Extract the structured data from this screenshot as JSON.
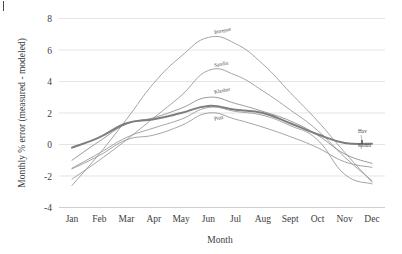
{
  "chart_data": {
    "type": "line",
    "title": "",
    "xlabel": "Month",
    "ylabel": "Monthly % error (measured - modeled)",
    "categories": [
      "Jan",
      "Feb",
      "Mar",
      "Apr",
      "May",
      "Jun",
      "Jul",
      "Aug",
      "Sept",
      "Oct",
      "Nov",
      "Dec"
    ],
    "ylim": [
      -4,
      8
    ],
    "yticks": [
      8,
      6,
      4,
      2,
      0,
      -2,
      -4
    ],
    "ytick_labels": [
      "8",
      "6",
      "4",
      "2",
      "0",
      "-2",
      "-4"
    ],
    "grid": true,
    "legend": "inline-series-labels",
    "series": [
      {
        "name": "Intrepse",
        "label_position": "above-peak",
        "color": "#9a9a9a",
        "width": 0.9,
        "values": [
          -2.6,
          -0.6,
          1.6,
          3.9,
          5.6,
          6.8,
          6.4,
          5.1,
          3.3,
          1.5,
          -0.5,
          -2.4
        ]
      },
      {
        "name": "Sandia",
        "label_position": "above-peak",
        "color": "#9a9a9a",
        "width": 0.9,
        "values": [
          -2.2,
          -1.0,
          0.3,
          1.7,
          3.1,
          4.7,
          4.4,
          3.4,
          2.2,
          0.9,
          -0.8,
          -2.3
        ]
      },
      {
        "name": "Klasher",
        "label_position": "above-peak",
        "color": "#8f8f8f",
        "width": 0.9,
        "values": [
          -1.0,
          0.2,
          1.3,
          1.7,
          2.3,
          3.0,
          2.6,
          2.1,
          1.5,
          0.6,
          -0.6,
          -1.2
        ]
      },
      {
        "name": "Pittz",
        "label_position": "below-peak",
        "color": "#9a9a9a",
        "width": 0.9,
        "values": [
          -1.55,
          -0.7,
          0.3,
          0.6,
          1.2,
          2.0,
          1.6,
          1.1,
          0.5,
          -0.2,
          -1.1,
          -1.45
        ]
      },
      {
        "name": "Hav",
        "label_position": "right-upper",
        "color": "#7d7d7d",
        "width": 2.0,
        "values": [
          -0.2,
          0.45,
          1.35,
          1.6,
          2.0,
          2.45,
          2.2,
          2.0,
          1.35,
          0.65,
          0.1,
          0.05
        ]
      },
      {
        "name": "Konni",
        "label_position": "right-lower",
        "color": "#9a9a9a",
        "width": 0.9,
        "values": [
          -1.5,
          -0.55,
          0.45,
          1.05,
          1.6,
          2.35,
          2.1,
          1.85,
          1.2,
          0.3,
          -1.9,
          -2.5
        ]
      }
    ]
  },
  "axis": {
    "y_title": "Monthly % error (measured - modeled)",
    "x_title": "Month"
  }
}
